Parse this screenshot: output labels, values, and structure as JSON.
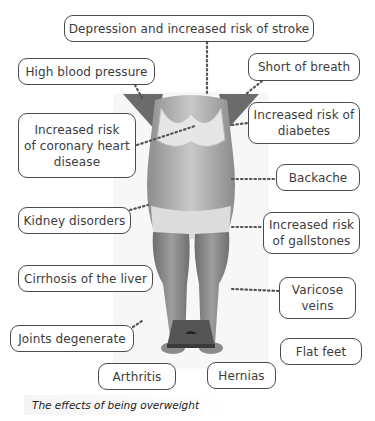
{
  "diagram": {
    "title": "The effects of being overweight",
    "center_image": "photo of overweight woman standing with arms raised, bathroom scale at feet",
    "labels": [
      {
        "id": "depression",
        "text": "Depression and increased risk of stroke"
      },
      {
        "id": "high-blood-pressure",
        "text": "High blood pressure"
      },
      {
        "id": "short-of-breath",
        "text": "Short of breath"
      },
      {
        "id": "coronary-heart-disease",
        "text": "Increased risk\nof coronary heart\ndisease"
      },
      {
        "id": "diabetes",
        "text": "Increased risk of\ndiabetes"
      },
      {
        "id": "backache",
        "text": "Backache"
      },
      {
        "id": "kidney-disorders",
        "text": "Kidney disorders"
      },
      {
        "id": "gallstones",
        "text": "Increased risk\nof gallstones"
      },
      {
        "id": "cirrhosis",
        "text": "Cirrhosis of the liver"
      },
      {
        "id": "varicose-veins",
        "text": "Varicose\nveins"
      },
      {
        "id": "joints-degenerate",
        "text": "Joints degenerate"
      },
      {
        "id": "flat-feet",
        "text": "Flat feet"
      },
      {
        "id": "arthritis",
        "text": "Arthritis"
      },
      {
        "id": "hernias",
        "text": "Hernias"
      }
    ]
  },
  "colors": {
    "border": "#4a4a4a",
    "text": "#3c3c3c",
    "connector": "#555555"
  }
}
